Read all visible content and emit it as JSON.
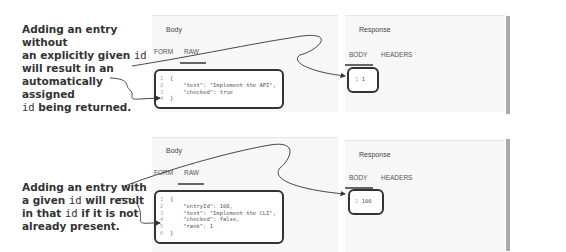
{
  "annotations": [
    {
      "parts": [
        "Adding an entry without",
        "an explicitly given ",
        "id",
        "will result in an",
        "automatically assigned",
        "id",
        " being returned."
      ]
    },
    {
      "parts": [
        "Adding an entry with",
        "a given ",
        "id",
        " will result",
        "in that ",
        "id",
        " if it is not",
        "already present."
      ]
    }
  ],
  "examples": [
    {
      "request": {
        "title": "Body",
        "tabs": [
          "FORM",
          "RAW"
        ],
        "active_tab": "RAW",
        "code_lines": [
          "{",
          "    \"text\": \"Implement the API\",",
          "    \"checked\": true",
          "}"
        ],
        "line_numbers": [
          "1",
          "2",
          "3",
          "4"
        ]
      },
      "response": {
        "title": "Response",
        "tabs": [
          "BODY",
          "HEADERS"
        ],
        "active_tab": "BODY",
        "line_number": "1",
        "value": "1"
      }
    },
    {
      "request": {
        "title": "Body",
        "tabs": [
          "FORM",
          "RAW"
        ],
        "active_tab": "RAW",
        "code_lines": [
          "{",
          "    \"entryId\": 100,",
          "    \"text\": \"Implement the CLI\",",
          "    \"checked\": false,",
          "    \"rank\": 1",
          "}"
        ],
        "line_numbers": [
          "1",
          "2",
          "3",
          "4",
          "5",
          "6"
        ]
      },
      "response": {
        "title": "Response",
        "tabs": [
          "BODY",
          "HEADERS"
        ],
        "active_tab": "BODY",
        "line_number": "1",
        "value": "100"
      }
    }
  ]
}
